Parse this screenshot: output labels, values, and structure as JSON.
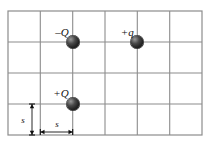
{
  "figure": {
    "background_color": "#ffffff",
    "grid": {
      "line_color": "#8c8c8c",
      "border_color": "#8c8c8c",
      "columns": 6,
      "rows": 4,
      "left": 8,
      "top": 11,
      "right": 202,
      "bottom": 135,
      "cell_width": 32.3,
      "cell_height": 31,
      "x_lines": [
        8,
        40.3,
        72.7,
        105,
        137.3,
        169.7,
        202
      ],
      "y_lines": [
        11,
        42,
        73,
        104,
        135
      ]
    },
    "charges": [
      {
        "id": "charge-negative-Q",
        "label": "–Q",
        "sign": "negative",
        "x": 72.7,
        "y": 42,
        "label_x": 69,
        "label_y": 32,
        "radius": 6.5,
        "color": "#222222"
      },
      {
        "id": "charge-positive-q",
        "label": "+q",
        "sign": "positive",
        "x": 137.3,
        "y": 42,
        "label_x": 134,
        "label_y": 32,
        "radius": 6.5,
        "color": "#222222"
      },
      {
        "id": "charge-positive-Q",
        "label": "+Q",
        "sign": "positive",
        "x": 72.7,
        "y": 104,
        "label_x": 69,
        "label_y": 93,
        "radius": 6.5,
        "color": "#222222"
      }
    ],
    "dimensions": [
      {
        "id": "vertical-spacing",
        "label": "s",
        "orientation": "vertical",
        "x": 32,
        "y_start": 104,
        "y_end": 135,
        "label_x": 23,
        "label_y": 120,
        "color": "#111111"
      },
      {
        "id": "horizontal-spacing",
        "label": "s",
        "orientation": "horizontal",
        "y": 132,
        "x_start": 40.3,
        "x_end": 72.7,
        "label_x": 57,
        "label_y": 124,
        "color": "#111111"
      }
    ]
  }
}
